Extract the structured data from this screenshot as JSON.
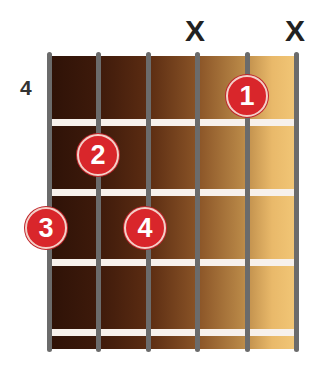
{
  "chord_diagram": {
    "start_fret_label": "4",
    "strings": 6,
    "frets_shown": 4,
    "muted_strings": [
      {
        "string_index": 3,
        "symbol": "X"
      },
      {
        "string_index": 5,
        "symbol": "X"
      }
    ],
    "fingers": [
      {
        "label": "1",
        "string_index": 4,
        "fret": 1
      },
      {
        "label": "2",
        "string_index": 1,
        "fret": 2
      },
      {
        "label": "3",
        "string_index": 0,
        "fret": 3
      },
      {
        "label": "4",
        "string_index": 2,
        "fret": 3
      }
    ],
    "colors": {
      "finger_dot": "#d9262b",
      "fret_wire": "#f7f1ec",
      "string": "#6b6b6b",
      "board_dark": "#2e1207",
      "board_light": "#f2c777"
    }
  }
}
